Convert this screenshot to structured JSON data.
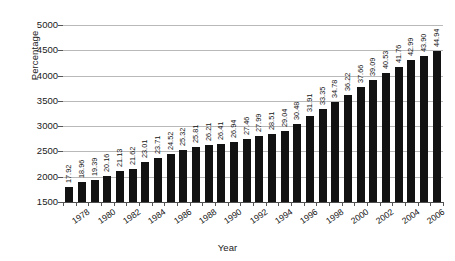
{
  "chart_data": {
    "type": "bar",
    "title": "",
    "xlabel": "Year",
    "ylabel": "Percentage",
    "ylim": [
      1500,
      5000
    ],
    "ytick_step": 500,
    "yticks": [
      "5000",
      "4500",
      "4000",
      "3500",
      "3000",
      "2500",
      "2000",
      "1500"
    ],
    "grid": true,
    "legend": "none",
    "bar_color": "#121212",
    "gridline_color": "#b9b9b9",
    "axis_color": "#4d4d4d",
    "background_color": "#ffffff",
    "value_labels_rotated": true,
    "xtick_label_interval": 2,
    "categories": [
      "1978",
      "1979",
      "1980",
      "1981",
      "1982",
      "1983",
      "1984",
      "1985",
      "1986",
      "1987",
      "1988",
      "1989",
      "1990",
      "1991",
      "1992",
      "1993",
      "1994",
      "1995",
      "1996",
      "1997",
      "1998",
      "1999",
      "2000",
      "2001",
      "2002",
      "2003",
      "2004",
      "2005",
      "2006",
      "2007"
    ],
    "xtick_labels": [
      "1978",
      "",
      "1980",
      "",
      "1982",
      "",
      "1984",
      "",
      "1986",
      "",
      "1988",
      "",
      "1990",
      "",
      "1992",
      "",
      "1994",
      "",
      "1996",
      "",
      "1998",
      "",
      "2000",
      "",
      "2002",
      "",
      "2004",
      "",
      "2006",
      ""
    ],
    "values": [
      17.92,
      18.96,
      19.39,
      20.16,
      21.13,
      21.62,
      23.01,
      23.71,
      24.52,
      25.32,
      25.81,
      26.21,
      26.41,
      26.94,
      27.46,
      27.99,
      28.51,
      29.04,
      30.48,
      31.91,
      33.35,
      34.78,
      36.22,
      37.66,
      39.09,
      40.53,
      41.76,
      42.99,
      43.9,
      44.94
    ],
    "value_labels": [
      "17.92",
      "18.96",
      "19.39",
      "20.16",
      "21.13",
      "21.62",
      "23.01",
      "23.71",
      "24.52",
      "25.32",
      "25.81",
      "26.21",
      "26.41",
      "26.94",
      "27.46",
      "27.99",
      "28.51",
      "29.04",
      "30.48",
      "31.91",
      "33.35",
      "34.78",
      "36.22",
      "37.66",
      "39.09",
      "40.53",
      "41.76",
      "42.99",
      "43.90",
      "44.94"
    ]
  }
}
